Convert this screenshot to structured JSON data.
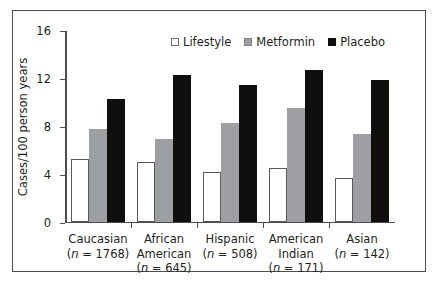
{
  "chart_data": {
    "type": "bar",
    "title": "",
    "xlabel": "",
    "ylabel": "Cases/100 person years",
    "ylim": [
      0,
      16
    ],
    "yticks": [
      0,
      4,
      8,
      12,
      16
    ],
    "ytick_labels": [
      "0",
      "4",
      "8",
      "12",
      "16"
    ],
    "grid": false,
    "legend_position": "top-center",
    "categories": [
      "Caucasian",
      "African American",
      "Hispanic",
      "American Indian",
      "Asian"
    ],
    "category_lines": [
      [
        "Caucasian",
        "(n = 1768)"
      ],
      [
        "African",
        "American",
        "(n = 645)"
      ],
      [
        "Hispanic",
        "(n = 508)"
      ],
      [
        "American",
        "Indian",
        "(n = 171)"
      ],
      [
        "Asian",
        "(n = 142)"
      ]
    ],
    "group_sizes": [
      1768,
      645,
      508,
      171,
      142
    ],
    "series": [
      {
        "name": "Lifestyle",
        "color": "#ffffff",
        "values": [
          5.2,
          5.0,
          4.1,
          4.5,
          3.6
        ]
      },
      {
        "name": "Metformin",
        "color": "#9d9fa2",
        "values": [
          7.7,
          6.9,
          8.2,
          9.5,
          7.3
        ]
      },
      {
        "name": "Placebo",
        "color": "#100f0d",
        "values": [
          10.2,
          12.2,
          11.4,
          12.6,
          11.8
        ]
      }
    ]
  },
  "legend": {
    "items": [
      {
        "label": "Lifestyle",
        "swatch": "open-square-icon"
      },
      {
        "label": "Metformin",
        "swatch": "gray-square-icon"
      },
      {
        "label": "Placebo",
        "swatch": "black-square-icon"
      }
    ]
  },
  "axes": {
    "y_title": "Cases/100 person years",
    "y_tick_labels": [
      "16",
      "12",
      "8",
      "4",
      "0"
    ]
  },
  "colors": {
    "frame": "#4d4d4d",
    "axis": "#4d4d4d",
    "text": "#231f20",
    "lifestyle": "#ffffff",
    "metformin": "#9d9fa2",
    "placebo": "#100f0d",
    "background": "#ffffff"
  }
}
